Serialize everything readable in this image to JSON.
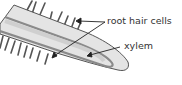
{
  "diagram": {
    "labels": [
      {
        "id": "root-hair-cells",
        "text": "root hair cells"
      },
      {
        "id": "xylem",
        "text": "xylem"
      }
    ],
    "colors": {
      "root_fill": "#e4e4e4",
      "root_outline": "#555555",
      "xylem_band": "#8a8a8a",
      "hairs": "#555555",
      "arrows": "#222222"
    }
  }
}
